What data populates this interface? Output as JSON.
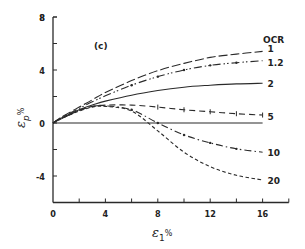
{
  "chart_data": {
    "type": "line",
    "title": "",
    "panel_label": "(c)",
    "xlabel": "ε1%",
    "xlabel_main": "ε",
    "xlabel_sub": "1",
    "xlabel_unit": "%",
    "ylabel": "εp%",
    "ylabel_main": "ε",
    "ylabel_sub": "p",
    "ylabel_unit": "%",
    "xlim": [
      0,
      18
    ],
    "ylim": [
      -6,
      8
    ],
    "xticks": [
      0,
      4,
      8,
      12,
      16
    ],
    "xticks_minor": [
      2,
      6,
      10,
      14,
      18
    ],
    "yticks": [
      -4,
      0,
      4,
      8
    ],
    "yticks_minor": [
      -2,
      2,
      6
    ],
    "grid": false,
    "legend_title": "OCR",
    "legend_position": "right, inline labels at curve ends",
    "x": [
      0,
      0.5,
      1,
      2,
      3,
      4,
      6,
      8,
      10,
      12,
      14,
      16
    ],
    "series": [
      {
        "name": "1",
        "style": "long-dash",
        "values": [
          0,
          0.35,
          0.65,
          1.2,
          1.75,
          2.3,
          3.2,
          3.95,
          4.5,
          4.95,
          5.2,
          5.4
        ]
      },
      {
        "name": "1.2",
        "style": "dash-dot-dot",
        "values": [
          0,
          0.33,
          0.6,
          1.1,
          1.6,
          2.05,
          2.85,
          3.5,
          4.0,
          4.35,
          4.55,
          4.7
        ]
      },
      {
        "name": "2",
        "style": "solid",
        "values": [
          0,
          0.3,
          0.55,
          1.0,
          1.35,
          1.65,
          2.1,
          2.45,
          2.7,
          2.85,
          2.95,
          3.0
        ]
      },
      {
        "name": "5",
        "style": "dash-with-ticks",
        "values": [
          0,
          0.28,
          0.5,
          0.95,
          1.25,
          1.35,
          1.35,
          1.2,
          1.0,
          0.85,
          0.7,
          0.6
        ]
      },
      {
        "name": "10",
        "style": "dash-dot",
        "values": [
          0,
          0.27,
          0.5,
          0.95,
          1.25,
          1.3,
          1.0,
          0.0,
          -0.9,
          -1.5,
          -1.95,
          -2.2
        ]
      },
      {
        "name": "20",
        "style": "short-dash",
        "values": [
          0,
          0.25,
          0.5,
          0.9,
          1.2,
          1.25,
          0.9,
          -0.6,
          -2.2,
          -3.3,
          -3.95,
          -4.3
        ]
      }
    ]
  }
}
